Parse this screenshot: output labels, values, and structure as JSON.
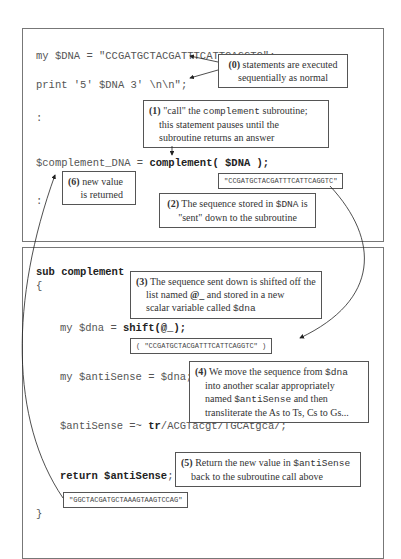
{
  "top_code": {
    "line1": "my $DNA = \"CCGATGCTACGATTTCATTCAGGTC\";",
    "line2": "print '5' $DNA 3' \\n\\n\";",
    "line3": ":",
    "line4_pre": "$complement_DNA = ",
    "line4_bold": "complement( $DNA );",
    "line5": ":"
  },
  "bottom_code": {
    "sub_line": "sub complement",
    "open_brace": "{",
    "shift_pre": "my $dna = ",
    "shift_bold": "shift(@_);",
    "assign": "my $antiSense = $dna;",
    "tr_pre": "$antiSense =~ ",
    "tr_bold": "tr",
    "tr_post": "/ACGTacgt/TGCAtgca/;",
    "return_bold": "return $antiSense",
    "return_post": ";",
    "close_brace": "}"
  },
  "notes": {
    "n0": {
      "num": "(0)",
      "text1": "statements are executed",
      "text2": "sequentially as normal"
    },
    "n1": {
      "num": "(1)",
      "q": "\"call\" the ",
      "mono": "complement",
      "tail": " subroutine;",
      "text2": "this statement pauses until the",
      "text3": "subroutine returns an answer"
    },
    "n2": {
      "num": "(2)",
      "text1a": "The sequence stored in ",
      "mono": "$DNA",
      "text1b": " is",
      "text2": "\"sent\" down to the subroutine"
    },
    "n3": {
      "num": "(3)",
      "text1": "The sequence sent down is shifted off the",
      "text2a": "list named ",
      "bold": "@_",
      "text2b": " and stored in a new",
      "text3a": "scalar variable called ",
      "mono": "$dna"
    },
    "n4": {
      "num": "(4)",
      "text1a": "We move the sequence from ",
      "mono1": "$dna",
      "text2": "into another scalar appropriately",
      "text3a": "named ",
      "mono2": "$antiSense",
      "text3b": " and then",
      "text4": "transliterate the As to Ts, Cs to Gs..."
    },
    "n5": {
      "num": "(5)",
      "text1a": "Return the new value in ",
      "mono": "$antiSense",
      "text2": "back to the subroutine call above"
    },
    "n6": {
      "num": "(6)",
      "text1": "new value",
      "text2": "is returned"
    }
  },
  "values": {
    "sent": "\"CCGATGCTACGATTTCATTCAGGTC\"",
    "list": "( \"CCGATGCTACGATTTCATTCAGGTC\" )",
    "returned": "\"GGCTACGATGCTAAAGTAAGTCCAG\""
  }
}
